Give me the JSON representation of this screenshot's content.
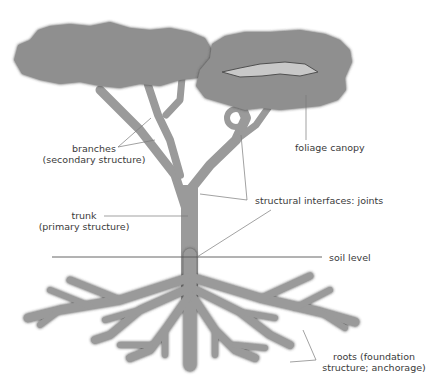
{
  "diagram": {
    "colors": {
      "fill": "#9a9a9a",
      "outline": "#4a4a4a",
      "leader_line": "#7a7a7a",
      "soil_line": "#555555",
      "text": "#3a3a3a",
      "background": "#ffffff"
    },
    "labels": {
      "branches": {
        "line1": "branches",
        "line2": "(secondary structure)"
      },
      "trunk": {
        "line1": "trunk",
        "line2": "(primary structure)"
      },
      "foliage": {
        "line1": "foliage canopy"
      },
      "joints": {
        "line1": "structural interfaces: joints"
      },
      "soil": {
        "line1": "soil level"
      },
      "roots": {
        "line1": "roots (foundation",
        "line2": "structure; anchorage)"
      }
    }
  }
}
